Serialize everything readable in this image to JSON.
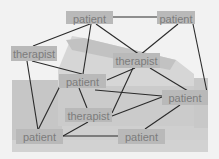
{
  "diagram": {
    "title": "",
    "background": "faded photograph of a house/building",
    "nodes": [
      {
        "id": "p_top",
        "label": "patient",
        "x": 66,
        "y": 11,
        "w": 47,
        "h": 13
      },
      {
        "id": "p_topright",
        "label": "patient",
        "x": 157,
        "y": 11,
        "w": 38,
        "h": 13
      },
      {
        "id": "t_left",
        "label": "therapist",
        "x": 11,
        "y": 46,
        "w": 46,
        "h": 15
      },
      {
        "id": "t_mid",
        "label": "therapist",
        "x": 113,
        "y": 53,
        "w": 47,
        "h": 15
      },
      {
        "id": "p_center",
        "label": "patient",
        "x": 59,
        "y": 74,
        "w": 47,
        "h": 14
      },
      {
        "id": "p_right",
        "label": "patient",
        "x": 162,
        "y": 90,
        "w": 46,
        "h": 15
      },
      {
        "id": "t_lower",
        "label": "therapist",
        "x": 65,
        "y": 108,
        "w": 47,
        "h": 14
      },
      {
        "id": "p_botleft",
        "label": "patient",
        "x": 16,
        "y": 129,
        "w": 47,
        "h": 15
      },
      {
        "id": "p_botcenter",
        "label": "patient",
        "x": 118,
        "y": 129,
        "w": 47,
        "h": 15
      }
    ],
    "edges": [
      {
        "from": "p_top",
        "to": "p_topright",
        "x1": 113,
        "y1": 17,
        "x2": 157,
        "y2": 17
      },
      {
        "from": "p_top",
        "to": "t_left",
        "x1": 90,
        "y1": 24,
        "x2": 33,
        "y2": 46
      },
      {
        "from": "p_top",
        "to": "p_center",
        "x1": 91,
        "y1": 24,
        "x2": 83,
        "y2": 74
      },
      {
        "from": "p_top",
        "to": "t_mid",
        "x1": 96,
        "y1": 24,
        "x2": 140,
        "y2": 55
      },
      {
        "from": "p_topright",
        "to": "t_mid",
        "x1": 178,
        "y1": 24,
        "x2": 140,
        "y2": 55
      },
      {
        "from": "p_topright",
        "to": "p_right",
        "x1": 193,
        "y1": 24,
        "x2": 207,
        "y2": 92
      },
      {
        "from": "t_left",
        "to": "p_center",
        "x1": 32,
        "y1": 61,
        "x2": 82,
        "y2": 74
      },
      {
        "from": "t_left",
        "to": "p_botleft",
        "x1": 27,
        "y1": 61,
        "x2": 38,
        "y2": 130
      },
      {
        "from": "t_mid",
        "to": "p_center",
        "x1": 135,
        "y1": 68,
        "x2": 107,
        "y2": 80
      },
      {
        "from": "t_mid",
        "to": "t_lower",
        "x1": 133,
        "y1": 68,
        "x2": 112,
        "y2": 113
      },
      {
        "from": "t_mid",
        "to": "p_right",
        "x1": 150,
        "y1": 68,
        "x2": 188,
        "y2": 91
      },
      {
        "from": "p_center",
        "to": "p_right",
        "x1": 95,
        "y1": 90,
        "x2": 162,
        "y2": 96
      },
      {
        "from": "p_center",
        "to": "t_lower",
        "x1": 79,
        "y1": 88,
        "x2": 87,
        "y2": 108
      },
      {
        "from": "p_center",
        "to": "p_botleft",
        "x1": 60,
        "y1": 86,
        "x2": 38,
        "y2": 130
      },
      {
        "from": "t_lower",
        "to": "p_right",
        "x1": 112,
        "y1": 116,
        "x2": 162,
        "y2": 97
      },
      {
        "from": "t_lower",
        "to": "p_botleft",
        "x1": 88,
        "y1": 122,
        "x2": 63,
        "y2": 136
      },
      {
        "from": "p_botleft",
        "to": "p_botcenter",
        "x1": 63,
        "y1": 136,
        "x2": 118,
        "y2": 136
      },
      {
        "from": "p_right",
        "to": "p_botcenter",
        "x1": 180,
        "y1": 105,
        "x2": 145,
        "y2": 129
      }
    ],
    "colors": {
      "page_bg": "#f2f2f2",
      "node_fill": "#b9b9b9",
      "node_text": "#7c7c7c",
      "edge": "#2a2a2a",
      "photo_light": "#dcdcdc",
      "photo_mid": "#c4c4c4"
    }
  }
}
